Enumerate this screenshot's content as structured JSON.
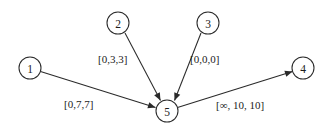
{
  "figure": {
    "type": "directed-graph-diagram",
    "background_color": "#ffffff",
    "stroke_color": "#2a2a2a",
    "text_color": "#1c1c1c"
  },
  "nodes": [
    {
      "id": "1",
      "label": "1",
      "cx": 30,
      "cy": 68,
      "r": 11
    },
    {
      "id": "2",
      "label": "2",
      "cx": 118,
      "cy": 23,
      "r": 11
    },
    {
      "id": "3",
      "label": "3",
      "cx": 208,
      "cy": 23,
      "r": 11
    },
    {
      "id": "4",
      "label": "4",
      "cx": 303,
      "cy": 68,
      "r": 11
    },
    {
      "id": "5",
      "label": "5",
      "cx": 167,
      "cy": 111,
      "r": 11
    }
  ],
  "edges": [
    {
      "id": "edge-1-5",
      "from": "1",
      "to": "5",
      "label": "[0,7,7]",
      "label_x": 64,
      "label_y": 108,
      "x1": 40.5,
      "y1": 71.5,
      "x2": 155.5,
      "y2": 107.5
    },
    {
      "id": "edge-2-5",
      "from": "2",
      "to": "5",
      "label": "[0,3,3]",
      "label_x": 98,
      "label_y": 63,
      "x1": 125,
      "y1": 33,
      "x2": 160.5,
      "y2": 100.5
    },
    {
      "id": "edge-3-5",
      "from": "3",
      "to": "5",
      "label": "[0,0,0]",
      "label_x": 190,
      "label_y": 63,
      "x1": 201,
      "y1": 33,
      "x2": 174.5,
      "y2": 100.5
    },
    {
      "id": "edge-5-4",
      "from": "5",
      "to": "4",
      "label": "[∞, 10, 10]",
      "label_x": 216,
      "label_y": 109,
      "x1": 177.5,
      "y1": 107.5,
      "x2": 292.5,
      "y2": 71.5
    }
  ]
}
